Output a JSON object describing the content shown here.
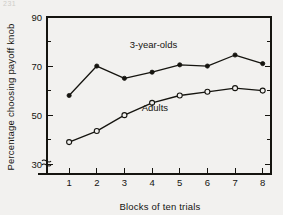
{
  "corner_mark": "231",
  "chart_data": {
    "type": "line",
    "title": "",
    "xlabel": "Blocks of ten trials",
    "ylabel": "Percentage choosing payoff knob",
    "x": [
      1,
      2,
      3,
      4,
      5,
      6,
      7,
      8
    ],
    "xtick_labels": [
      "1",
      "2",
      "3",
      "4",
      "5",
      "6",
      "7",
      "8"
    ],
    "ytick_labels": [
      "30",
      "50",
      "70",
      "90"
    ],
    "ytick_values": [
      30,
      50,
      70,
      90
    ],
    "yminor_values": [
      40,
      60,
      80
    ],
    "ylim": [
      26,
      90
    ],
    "xlim": [
      0.2,
      8.3
    ],
    "axis_break": true,
    "grid": false,
    "legend_position": "inline-annotation",
    "series": [
      {
        "name": "3-year-olds",
        "marker": "filled-circle",
        "label_x": 4.05,
        "label_y": 77.5,
        "values": [
          58,
          70,
          65,
          67.5,
          70.5,
          70,
          74.5,
          71
        ]
      },
      {
        "name": "Adults",
        "marker": "open-circle",
        "label_x": 4.1,
        "label_y": 51.5,
        "values": [
          39,
          43.5,
          50,
          55,
          58,
          59.5,
          61,
          60
        ]
      }
    ]
  }
}
